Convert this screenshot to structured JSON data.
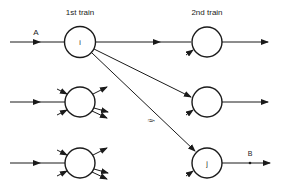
{
  "diagram": {
    "labels": {
      "first_train": "1st train",
      "second_train": "2nd train",
      "input_a": "A",
      "output_b": "B",
      "edge_ij": "ij"
    },
    "nodes": [
      {
        "id": "n-i",
        "label": "i",
        "column": "1st train",
        "row": 1
      },
      {
        "id": "n-left-2",
        "label": "",
        "column": "1st train",
        "row": 2
      },
      {
        "id": "n-left-3",
        "label": "",
        "column": "1st train",
        "row": 3
      },
      {
        "id": "n-right-1",
        "label": "",
        "column": "2nd train",
        "row": 1
      },
      {
        "id": "n-right-2",
        "label": "",
        "column": "2nd train",
        "row": 2
      },
      {
        "id": "n-j",
        "label": "j",
        "column": "2nd train",
        "row": 3
      }
    ],
    "edges": [
      {
        "from": "A",
        "to": "i"
      },
      {
        "from": "i",
        "to": "2nd train row 1"
      },
      {
        "from": "i",
        "to": "2nd train row 2"
      },
      {
        "from": "i",
        "to": "j",
        "label": "ij"
      },
      {
        "from": "j",
        "to": "B"
      }
    ],
    "colors": {
      "stroke": "#1a1a1a",
      "background": "#ffffff"
    }
  }
}
